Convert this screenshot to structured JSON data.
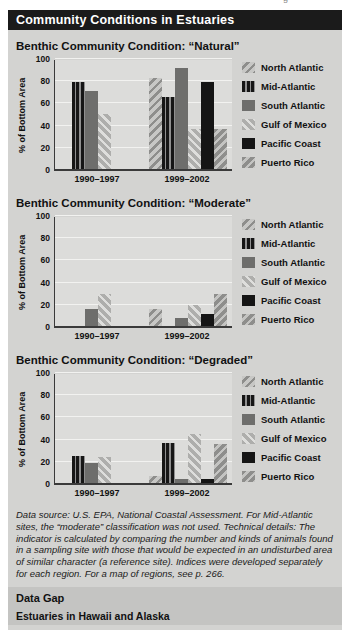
{
  "page": {
    "top_edge_fragment": "g"
  },
  "header": {
    "title": "Community Conditions in Estuaries"
  },
  "chart_data": [
    {
      "type": "bar",
      "title": "Benthic Community Condition: “Natural”",
      "ylabel": "% of Bottom Area",
      "ylim": [
        0,
        100
      ],
      "yticks": [
        0,
        20,
        40,
        60,
        80,
        100
      ],
      "grid": true,
      "legend_position": "right",
      "categories": [
        "1990–1997",
        "1999–2002"
      ],
      "series": [
        {
          "name": "North Atlantic",
          "values": [
            null,
            82
          ]
        },
        {
          "name": "Mid-Atlantic",
          "values": [
            78,
            65
          ]
        },
        {
          "name": "South Atlantic",
          "values": [
            70,
            91
          ]
        },
        {
          "name": "Gulf of Mexico",
          "values": [
            50,
            36
          ]
        },
        {
          "name": "Pacific Coast",
          "values": [
            null,
            78
          ]
        },
        {
          "name": "Puerto Rico",
          "values": [
            null,
            36
          ]
        }
      ]
    },
    {
      "type": "bar",
      "title": "Benthic Community Condition: “Moderate”",
      "ylabel": "% of Bottom Area",
      "ylim": [
        0,
        100
      ],
      "yticks": [
        0,
        20,
        40,
        60,
        80,
        100
      ],
      "grid": true,
      "legend_position": "right",
      "categories": [
        "1990–1997",
        "1999–2002"
      ],
      "series": [
        {
          "name": "North Atlantic",
          "values": [
            null,
            15
          ]
        },
        {
          "name": "Mid-Atlantic",
          "values": [
            null,
            null
          ]
        },
        {
          "name": "South Atlantic",
          "values": [
            15,
            7
          ]
        },
        {
          "name": "Gulf of Mexico",
          "values": [
            29,
            19
          ]
        },
        {
          "name": "Pacific Coast",
          "values": [
            null,
            11
          ]
        },
        {
          "name": "Puerto Rico",
          "values": [
            null,
            29
          ]
        }
      ]
    },
    {
      "type": "bar",
      "title": "Benthic Community Condition: “Degraded”",
      "ylabel": "% of Bottom Area",
      "ylim": [
        0,
        100
      ],
      "yticks": [
        0,
        20,
        40,
        60,
        80,
        100
      ],
      "grid": true,
      "legend_position": "right",
      "categories": [
        "1990–1997",
        "1999–2002"
      ],
      "series": [
        {
          "name": "North Atlantic",
          "values": [
            null,
            6
          ]
        },
        {
          "name": "Mid-Atlantic",
          "values": [
            24,
            36
          ]
        },
        {
          "name": "South Atlantic",
          "values": [
            18,
            4
          ]
        },
        {
          "name": "Gulf of Mexico",
          "values": [
            23,
            44
          ]
        },
        {
          "name": "Pacific Coast",
          "values": [
            null,
            4
          ]
        },
        {
          "name": "Puerto Rico",
          "values": [
            null,
            35
          ]
        }
      ]
    }
  ],
  "series_styles": [
    {
      "name": "North Atlantic",
      "pattern": "diagonal-up",
      "bg": "#c7c7c5",
      "stripe": "#8e8e8c"
    },
    {
      "name": "Mid-Atlantic",
      "pattern": "vertical",
      "bg": "#161616",
      "stripe": "#909090"
    },
    {
      "name": "South Atlantic",
      "pattern": "solid",
      "bg": "#6e6e6c",
      "stripe": ""
    },
    {
      "name": "Gulf of Mexico",
      "pattern": "diagonal-down",
      "bg": "#aeaeac",
      "stripe": "#dededc"
    },
    {
      "name": "Pacific Coast",
      "pattern": "solid",
      "bg": "#151515",
      "stripe": ""
    },
    {
      "name": "Puerto Rico",
      "pattern": "diagonal-up",
      "bg": "#8e8e8c",
      "stripe": "#c4c4c2"
    }
  ],
  "colors": {
    "panel_bg": "#d3d3d1",
    "plot_bg": "#dcdcda",
    "header_bg": "#1b1b1b",
    "header_text": "#ffffff",
    "gridline": "#f2f2f0",
    "axis": "#3a3a3a",
    "datagap_bg": "#c4c4c2",
    "text": "#111111"
  },
  "footnote": "Data source: U.S. EPA, National Coastal Assessment. For Mid-Atlantic sites, the “moderate” classification was not used. Technical details: The indicator is calculated by comparing the number and kinds of animals found in a sampling site with those that would be expected in an undisturbed area of similar character (a reference site). Indices were developed separately for each region. For a map of regions, see p. 266.",
  "data_gap": {
    "heading": "Data Gap",
    "text": "Estuaries in Hawaii and Alaska"
  }
}
